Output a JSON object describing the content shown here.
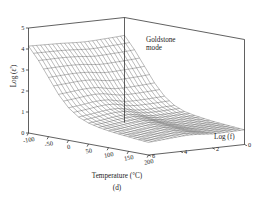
{
  "figure": {
    "panel_letter": "(d)",
    "annotation": {
      "line1": "Goldstone",
      "line2": "mode"
    },
    "background_color": "#ffffff",
    "line_color": "#1c1c1c",
    "mesh_color": "#262626"
  },
  "chart_data": {
    "type": "surface",
    "title": "",
    "subtitle": "",
    "panel": "(d)",
    "xlabel": "Temperature (°C)",
    "ylabel": "Log (f)",
    "zlabel": "Log (ε')",
    "xlim": [
      -100,
      200
    ],
    "ylim": [
      0,
      6
    ],
    "zlim": [
      0,
      5
    ],
    "xticks": [
      -100,
      -50,
      0,
      50,
      100,
      150,
      200
    ],
    "xticklabels": [
      "-100",
      "-50",
      "0",
      "50",
      "100",
      "150",
      "200"
    ],
    "yticks": [
      0,
      2,
      4,
      6
    ],
    "yticklabels": [
      "0",
      "2",
      "4",
      "6"
    ],
    "zticks": [
      0,
      1,
      2,
      3,
      4,
      5
    ],
    "zticklabels": [
      "0",
      "1",
      "2",
      "3",
      "4",
      "5"
    ],
    "grid": false,
    "legend": false,
    "annotations": [
      {
        "text": "Goldstone mode",
        "x": 120,
        "y": 1.0,
        "z": 4.2
      }
    ],
    "x": [
      -100,
      -75,
      -50,
      -25,
      0,
      25,
      50,
      75,
      100,
      125,
      150,
      175,
      200
    ],
    "y": [
      0,
      0.5,
      1,
      1.5,
      2,
      2.5,
      3,
      3.5,
      4,
      4.5,
      5,
      5.5,
      6
    ],
    "z_description": "Log(epsilon') surface: low plateau (~0.6-1.2) across most of temperature-frequency plane, rising sharply to ~4.2 at low Log(f) (near 0) for all temperatures, with the Goldstone mode ridge on the low-frequency edge.",
    "z": [
      [
        4.15,
        3.55,
        2.85,
        2.15,
        1.6,
        1.25,
        1.05,
        0.95,
        0.88,
        0.82,
        0.78,
        0.74,
        0.7
      ],
      [
        4.12,
        3.52,
        2.82,
        2.12,
        1.58,
        1.24,
        1.04,
        0.94,
        0.87,
        0.81,
        0.77,
        0.73,
        0.69
      ],
      [
        4.1,
        3.5,
        2.8,
        2.1,
        1.56,
        1.22,
        1.03,
        0.93,
        0.86,
        0.8,
        0.76,
        0.72,
        0.68
      ],
      [
        4.08,
        3.48,
        2.78,
        2.08,
        1.55,
        1.21,
        1.02,
        0.92,
        0.85,
        0.79,
        0.75,
        0.71,
        0.67
      ],
      [
        4.06,
        3.46,
        2.76,
        2.07,
        1.54,
        1.21,
        1.02,
        0.92,
        0.85,
        0.79,
        0.75,
        0.71,
        0.67
      ],
      [
        4.05,
        3.45,
        2.76,
        2.08,
        1.56,
        1.24,
        1.06,
        0.96,
        0.89,
        0.83,
        0.78,
        0.74,
        0.7
      ],
      [
        4.06,
        3.48,
        2.8,
        2.14,
        1.64,
        1.33,
        1.15,
        1.04,
        0.96,
        0.89,
        0.83,
        0.78,
        0.73
      ],
      [
        4.08,
        3.52,
        2.86,
        2.22,
        1.72,
        1.4,
        1.2,
        1.08,
        0.99,
        0.91,
        0.85,
        0.79,
        0.74
      ],
      [
        4.1,
        3.54,
        2.88,
        2.24,
        1.73,
        1.4,
        1.19,
        1.06,
        0.97,
        0.89,
        0.83,
        0.77,
        0.72
      ],
      [
        4.11,
        3.55,
        2.88,
        2.22,
        1.7,
        1.36,
        1.15,
        1.02,
        0.93,
        0.85,
        0.79,
        0.74,
        0.69
      ],
      [
        4.12,
        3.55,
        2.86,
        2.18,
        1.64,
        1.3,
        1.09,
        0.97,
        0.88,
        0.81,
        0.76,
        0.71,
        0.66
      ],
      [
        4.13,
        3.54,
        2.84,
        2.14,
        1.59,
        1.25,
        1.04,
        0.92,
        0.84,
        0.77,
        0.72,
        0.67,
        0.63
      ],
      [
        4.14,
        3.54,
        2.82,
        2.1,
        1.55,
        1.2,
        1.0,
        0.88,
        0.8,
        0.74,
        0.69,
        0.64,
        0.6
      ]
    ]
  }
}
